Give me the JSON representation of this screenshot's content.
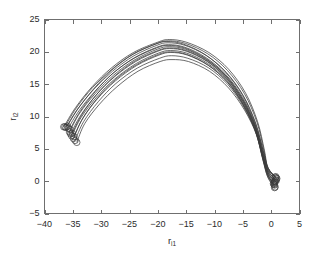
{
  "chart_data": {
    "type": "line",
    "title": "",
    "subtitle": "",
    "xlabel": "r",
    "xlabel_sub": "i1",
    "ylabel": "r",
    "ylabel_sub": "i2",
    "xlim": [
      -40,
      5
    ],
    "ylim": [
      -5,
      25
    ],
    "xticks": [
      -40,
      -35,
      -30,
      -25,
      -20,
      -15,
      -10,
      -5,
      0,
      5
    ],
    "yticks": [
      -5,
      0,
      5,
      10,
      15,
      20,
      25
    ],
    "xtick_labels": [
      "-40",
      "-35",
      "-30",
      "-25",
      "-20",
      "-15",
      "-10",
      "-5",
      "0",
      "5"
    ],
    "ytick_labels": [
      "-5",
      "0",
      "5",
      "10",
      "15",
      "20",
      "25"
    ],
    "grid": false,
    "legend": null,
    "legend_position": "none",
    "line_color": "#3a3a3a",
    "marker": "circle",
    "marker_size": 4,
    "series_count": 14,
    "series": [
      {
        "name": "traj-1",
        "start": [
          -36.6,
          8.4
        ],
        "apex": [
          -18.0,
          21.9
        ],
        "end": [
          0.7,
          0.6
        ],
        "points": [
          [
            -36.6,
            8.4
          ],
          [
            -34.5,
            11.4
          ],
          [
            -31.6,
            14.6
          ],
          [
            -28.2,
            17.5
          ],
          [
            -24.3,
            19.9
          ],
          [
            -20.0,
            21.5
          ],
          [
            -18.0,
            21.9
          ],
          [
            -15.0,
            21.5
          ],
          [
            -11.0,
            19.9
          ],
          [
            -7.5,
            17.3
          ],
          [
            -4.5,
            13.6
          ],
          [
            -2.4,
            9.2
          ],
          [
            -1.2,
            4.8
          ],
          [
            -0.6,
            2.1
          ],
          [
            0.7,
            0.6
          ]
        ]
      },
      {
        "name": "traj-2",
        "start": [
          -36.2,
          8.3
        ],
        "apex": [
          -18.2,
          21.4
        ],
        "end": [
          0.9,
          0.5
        ],
        "points": [
          [
            -36.2,
            8.3
          ],
          [
            -34.2,
            11.1
          ],
          [
            -31.3,
            14.2
          ],
          [
            -28.0,
            17.0
          ],
          [
            -24.2,
            19.4
          ],
          [
            -20.2,
            21.0
          ],
          [
            -18.2,
            21.4
          ],
          [
            -15.2,
            21.0
          ],
          [
            -11.4,
            19.4
          ],
          [
            -7.9,
            16.8
          ],
          [
            -4.9,
            13.2
          ],
          [
            -2.7,
            8.9
          ],
          [
            -1.4,
            4.6
          ],
          [
            -0.6,
            1.9
          ],
          [
            0.9,
            0.5
          ]
        ]
      },
      {
        "name": "traj-3",
        "start": [
          -35.8,
          8.2
        ],
        "apex": [
          -18.1,
          21.1
        ],
        "end": [
          0.8,
          0.2
        ],
        "points": [
          [
            -35.8,
            8.2
          ],
          [
            -33.9,
            10.9
          ],
          [
            -31.1,
            13.9
          ],
          [
            -27.9,
            16.7
          ],
          [
            -24.1,
            19.1
          ],
          [
            -20.2,
            20.7
          ],
          [
            -18.1,
            21.1
          ],
          [
            -15.2,
            20.7
          ],
          [
            -11.5,
            19.1
          ],
          [
            -8.0,
            16.5
          ],
          [
            -5.0,
            12.9
          ],
          [
            -2.8,
            8.7
          ],
          [
            -1.5,
            4.4
          ],
          [
            -0.6,
            1.7
          ],
          [
            0.8,
            0.2
          ]
        ]
      },
      {
        "name": "traj-4",
        "start": [
          -35.6,
          7.6
        ],
        "apex": [
          -18.0,
          20.8
        ],
        "end": [
          0.6,
          0.0
        ],
        "points": [
          [
            -35.6,
            7.6
          ],
          [
            -33.8,
            10.5
          ],
          [
            -31.0,
            13.6
          ],
          [
            -27.8,
            16.4
          ],
          [
            -24.0,
            18.8
          ],
          [
            -20.1,
            20.4
          ],
          [
            -18.0,
            20.8
          ],
          [
            -15.1,
            20.4
          ],
          [
            -11.4,
            18.8
          ],
          [
            -7.9,
            16.2
          ],
          [
            -5.0,
            12.6
          ],
          [
            -2.8,
            8.4
          ],
          [
            -1.5,
            4.2
          ],
          [
            -0.6,
            1.5
          ],
          [
            0.6,
            0.0
          ]
        ]
      },
      {
        "name": "traj-5",
        "start": [
          -35.4,
          7.3
        ],
        "apex": [
          -17.9,
          20.5
        ],
        "end": [
          0.5,
          -0.2
        ],
        "points": [
          [
            -35.4,
            7.3
          ],
          [
            -33.6,
            10.2
          ],
          [
            -30.9,
            13.3
          ],
          [
            -27.7,
            16.1
          ],
          [
            -23.9,
            18.5
          ],
          [
            -20.0,
            20.1
          ],
          [
            -17.9,
            20.5
          ],
          [
            -15.0,
            20.1
          ],
          [
            -11.3,
            18.5
          ],
          [
            -7.9,
            15.9
          ],
          [
            -5.0,
            12.3
          ],
          [
            -2.8,
            8.2
          ],
          [
            -1.5,
            4.0
          ],
          [
            -0.6,
            1.3
          ],
          [
            0.5,
            -0.2
          ]
        ]
      },
      {
        "name": "traj-6",
        "start": [
          -35.2,
          7.0
        ],
        "apex": [
          -17.8,
          20.2
        ],
        "end": [
          0.4,
          -0.4
        ],
        "points": [
          [
            -35.2,
            7.0
          ],
          [
            -33.5,
            9.9
          ],
          [
            -30.8,
            13.0
          ],
          [
            -27.6,
            15.8
          ],
          [
            -23.8,
            18.2
          ],
          [
            -19.9,
            19.8
          ],
          [
            -17.8,
            20.2
          ],
          [
            -14.9,
            19.8
          ],
          [
            -11.2,
            18.2
          ],
          [
            -7.8,
            15.6
          ],
          [
            -5.0,
            12.1
          ],
          [
            -2.8,
            8.0
          ],
          [
            -1.5,
            3.8
          ],
          [
            -0.6,
            1.1
          ],
          [
            0.4,
            -0.4
          ]
        ]
      },
      {
        "name": "traj-7",
        "start": [
          -34.9,
          6.6
        ],
        "apex": [
          -17.7,
          19.9
        ],
        "end": [
          0.6,
          -0.6
        ],
        "points": [
          [
            -34.9,
            6.6
          ],
          [
            -33.3,
            9.6
          ],
          [
            -30.7,
            12.7
          ],
          [
            -27.5,
            15.5
          ],
          [
            -23.7,
            17.9
          ],
          [
            -19.8,
            19.5
          ],
          [
            -17.7,
            19.9
          ],
          [
            -14.8,
            19.5
          ],
          [
            -11.1,
            17.9
          ],
          [
            -7.7,
            15.3
          ],
          [
            -4.9,
            11.8
          ],
          [
            -2.8,
            7.8
          ],
          [
            -1.5,
            3.6
          ],
          [
            -0.6,
            0.9
          ],
          [
            0.6,
            -0.6
          ]
        ]
      },
      {
        "name": "traj-8",
        "start": [
          -34.6,
          6.3
        ],
        "apex": [
          -17.6,
          19.4
        ],
        "end": [
          0.7,
          -0.9
        ],
        "points": [
          [
            -34.6,
            6.3
          ],
          [
            -33.1,
            9.2
          ],
          [
            -30.5,
            12.3
          ],
          [
            -27.4,
            15.1
          ],
          [
            -23.6,
            17.5
          ],
          [
            -19.7,
            19.0
          ],
          [
            -17.6,
            19.4
          ],
          [
            -14.7,
            19.0
          ],
          [
            -11.0,
            17.5
          ],
          [
            -7.6,
            14.9
          ],
          [
            -4.8,
            11.4
          ],
          [
            -2.7,
            7.5
          ],
          [
            -1.5,
            3.4
          ],
          [
            -0.6,
            0.7
          ],
          [
            0.7,
            -0.9
          ]
        ]
      },
      {
        "name": "traj-9",
        "start": [
          -36.0,
          8.5
        ],
        "apex": [
          -18.4,
          21.6
        ],
        "end": [
          1.0,
          0.4
        ],
        "points": [
          [
            -36.0,
            8.5
          ],
          [
            -34.0,
            11.3
          ],
          [
            -31.2,
            14.4
          ],
          [
            -28.1,
            17.2
          ],
          [
            -24.4,
            19.6
          ],
          [
            -20.4,
            21.2
          ],
          [
            -18.4,
            21.6
          ],
          [
            -15.5,
            21.2
          ],
          [
            -11.7,
            19.6
          ],
          [
            -8.2,
            17.0
          ],
          [
            -5.1,
            13.4
          ],
          [
            -2.8,
            9.0
          ],
          [
            -1.4,
            4.7
          ],
          [
            -0.5,
            2.0
          ],
          [
            1.0,
            0.4
          ]
        ]
      },
      {
        "name": "traj-10",
        "start": [
          -35.5,
          8.0
        ],
        "apex": [
          -18.2,
          21.0
        ],
        "end": [
          0.9,
          0.1
        ],
        "points": [
          [
            -35.5,
            8.0
          ],
          [
            -33.7,
            10.8
          ],
          [
            -31.0,
            13.9
          ],
          [
            -27.9,
            16.7
          ],
          [
            -24.2,
            19.0
          ],
          [
            -20.2,
            20.6
          ],
          [
            -18.2,
            21.0
          ],
          [
            -15.3,
            20.6
          ],
          [
            -11.6,
            19.0
          ],
          [
            -8.1,
            16.4
          ],
          [
            -5.1,
            12.8
          ],
          [
            -2.8,
            8.6
          ],
          [
            -1.4,
            4.3
          ],
          [
            -0.5,
            1.6
          ],
          [
            0.9,
            0.1
          ]
        ]
      },
      {
        "name": "traj-11",
        "start": [
          -35.1,
          7.4
        ],
        "apex": [
          -17.9,
          20.6
        ],
        "end": [
          0.7,
          -0.1
        ],
        "points": [
          [
            -35.1,
            7.4
          ],
          [
            -33.4,
            10.3
          ],
          [
            -30.8,
            13.4
          ],
          [
            -27.7,
            16.2
          ],
          [
            -24.0,
            18.6
          ],
          [
            -20.0,
            20.2
          ],
          [
            -17.9,
            20.6
          ],
          [
            -15.0,
            20.2
          ],
          [
            -11.3,
            18.6
          ],
          [
            -7.9,
            16.0
          ],
          [
            -5.0,
            12.4
          ],
          [
            -2.8,
            8.3
          ],
          [
            -1.5,
            4.1
          ],
          [
            -0.6,
            1.4
          ],
          [
            0.7,
            -0.1
          ]
        ]
      },
      {
        "name": "traj-12",
        "start": [
          -34.8,
          6.9
        ],
        "apex": [
          -17.8,
          20.0
        ],
        "end": [
          0.5,
          -0.5
        ],
        "points": [
          [
            -34.8,
            6.9
          ],
          [
            -33.2,
            9.8
          ],
          [
            -30.6,
            12.9
          ],
          [
            -27.5,
            15.7
          ],
          [
            -23.8,
            18.0
          ],
          [
            -19.9,
            19.6
          ],
          [
            -17.8,
            20.0
          ],
          [
            -14.9,
            19.6
          ],
          [
            -11.2,
            18.0
          ],
          [
            -7.8,
            15.4
          ],
          [
            -5.0,
            11.9
          ],
          [
            -2.8,
            7.9
          ],
          [
            -1.5,
            3.7
          ],
          [
            -0.6,
            1.0
          ],
          [
            0.5,
            -0.5
          ]
        ]
      },
      {
        "name": "traj-13",
        "start": [
          -36.4,
          8.4
        ],
        "apex": [
          -18.1,
          21.7
        ],
        "end": [
          0.8,
          0.7
        ],
        "points": [
          [
            -36.4,
            8.4
          ],
          [
            -34.4,
            11.3
          ],
          [
            -31.5,
            14.5
          ],
          [
            -28.1,
            17.3
          ],
          [
            -24.3,
            19.7
          ],
          [
            -20.1,
            21.3
          ],
          [
            -18.1,
            21.7
          ],
          [
            -15.1,
            21.3
          ],
          [
            -11.2,
            19.7
          ],
          [
            -7.7,
            17.1
          ],
          [
            -4.7,
            13.5
          ],
          [
            -2.5,
            9.1
          ],
          [
            -1.3,
            4.8
          ],
          [
            -0.6,
            2.1
          ],
          [
            0.8,
            0.7
          ]
        ]
      },
      {
        "name": "traj-14",
        "start": [
          -34.3,
          6.0
        ],
        "apex": [
          -17.5,
          18.8
        ],
        "end": [
          0.6,
          -1.0
        ],
        "points": [
          [
            -34.3,
            6.0
          ],
          [
            -32.9,
            8.9
          ],
          [
            -30.3,
            11.9
          ],
          [
            -27.2,
            14.6
          ],
          [
            -23.5,
            17.0
          ],
          [
            -19.6,
            18.5
          ],
          [
            -17.5,
            18.8
          ],
          [
            -14.6,
            18.5
          ],
          [
            -10.9,
            17.0
          ],
          [
            -7.5,
            14.4
          ],
          [
            -4.7,
            11.0
          ],
          [
            -2.6,
            7.2
          ],
          [
            -1.4,
            3.2
          ],
          [
            -0.6,
            0.6
          ],
          [
            0.6,
            -1.0
          ]
        ]
      }
    ],
    "start_markers": [
      [
        -36.6,
        8.4
      ],
      [
        -36.2,
        8.3
      ],
      [
        -35.8,
        8.2
      ],
      [
        -35.6,
        7.6
      ],
      [
        -35.4,
        7.3
      ],
      [
        -35.2,
        7.0
      ],
      [
        -34.9,
        6.6
      ],
      [
        -34.6,
        6.3
      ],
      [
        -36.0,
        8.5
      ],
      [
        -35.5,
        8.0
      ],
      [
        -35.1,
        7.4
      ],
      [
        -34.8,
        6.9
      ],
      [
        -36.4,
        8.4
      ],
      [
        -34.3,
        6.0
      ]
    ],
    "end_markers": [
      [
        0.7,
        0.6
      ],
      [
        0.9,
        0.5
      ],
      [
        0.8,
        0.2
      ],
      [
        0.6,
        0.0
      ],
      [
        0.5,
        -0.2
      ],
      [
        0.4,
        -0.4
      ],
      [
        0.6,
        -0.6
      ],
      [
        0.7,
        -0.9
      ],
      [
        1.0,
        0.4
      ],
      [
        0.9,
        0.1
      ],
      [
        0.7,
        -0.1
      ],
      [
        0.5,
        -0.5
      ],
      [
        0.8,
        0.7
      ],
      [
        0.6,
        -1.0
      ]
    ]
  }
}
